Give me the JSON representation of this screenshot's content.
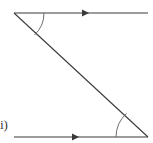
{
  "figure": {
    "part_label": "ii)",
    "stroke_color": "#3a3a3a",
    "arc_color": "#6e6e6e",
    "background_color": "#ffffff",
    "width": 153,
    "height": 143
  },
  "diagram_data": {
    "type": "geometry-parallel-lines-transversal",
    "description": "Two parallel horizontal lines cut by a transversal, with an angle arc marked at each intersection",
    "elements": [
      {
        "name": "top-parallel-line",
        "kind": "ray",
        "from": [
          14,
          13
        ],
        "to": [
          148,
          13
        ],
        "marker": "single-arrowhead",
        "marker_position": [
          86,
          13
        ],
        "marker_direction": "right"
      },
      {
        "name": "bottom-parallel-line",
        "kind": "ray",
        "from": [
          14,
          137
        ],
        "to": [
          148,
          137
        ],
        "marker": "single-arrowhead",
        "marker_position": [
          76,
          137
        ],
        "marker_direction": "right"
      },
      {
        "name": "transversal-line",
        "kind": "segment",
        "from": [
          14,
          13
        ],
        "to": [
          148,
          137
        ],
        "marker": "none"
      },
      {
        "name": "top-angle-arc",
        "kind": "arc",
        "vertex": [
          14,
          13
        ],
        "radius": 30,
        "between": [
          "top-parallel-line",
          "transversal-line"
        ]
      },
      {
        "name": "bottom-angle-arc",
        "kind": "arc",
        "vertex": [
          148,
          137
        ],
        "radius": 32,
        "between": [
          "bottom-parallel-line",
          "transversal-line"
        ]
      }
    ]
  }
}
